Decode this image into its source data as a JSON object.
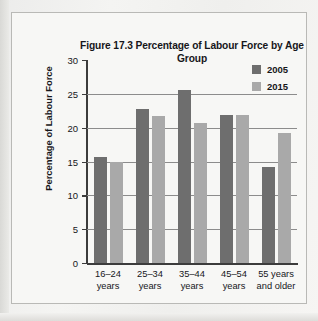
{
  "figure": {
    "title_line1": "Figure 17.3 Percentage of Labour Force",
    "title_line2": "by Age Group"
  },
  "legend": {
    "position": "top-right",
    "entries": [
      {
        "label": "2005",
        "color": "#6e6e6e"
      },
      {
        "label": "2015",
        "color": "#a9a9a9"
      }
    ]
  },
  "axes": {
    "y_title": "Percentage of Labour Force",
    "y_ticks": [
      "30",
      "25",
      "20",
      "15",
      "10",
      "5",
      "0"
    ],
    "x_labels": [
      {
        "line1": "16–24",
        "line2": "years"
      },
      {
        "line1": "25–34",
        "line2": "years"
      },
      {
        "line1": "35–44",
        "line2": "years"
      },
      {
        "line1": "45–54",
        "line2": "years"
      },
      {
        "line1": "55 years",
        "line2": "and older"
      }
    ]
  },
  "chart_data": {
    "type": "bar",
    "title": "Figure 17.3 Percentage of Labour Force by Age Group",
    "xlabel": "",
    "ylabel": "Percentage of Labour Force",
    "ylim": [
      0,
      30
    ],
    "ytick_step": 5,
    "grid": true,
    "legend_position": "top-right",
    "categories": [
      "16–24 years",
      "25–34 years",
      "35–44 years",
      "45–54 years",
      "55 years and older"
    ],
    "series": [
      {
        "name": "2005",
        "color": "#6e6e6e",
        "values": [
          15.6,
          22.7,
          25.5,
          21.9,
          14.2
        ]
      },
      {
        "name": "2015",
        "color": "#a9a9a9",
        "values": [
          15.0,
          21.8,
          20.7,
          21.9,
          19.2
        ]
      }
    ]
  }
}
